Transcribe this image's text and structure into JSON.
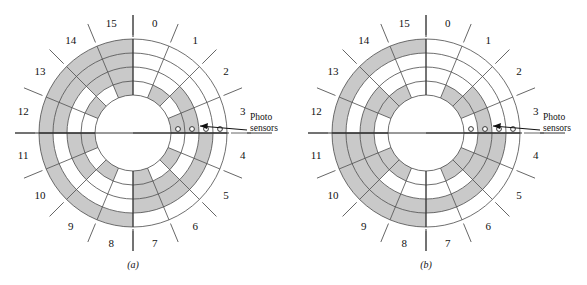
{
  "figure": {
    "type": "absolute-encoder-disk-diagram",
    "panels": [
      {
        "id": "a",
        "caption": "(a)",
        "encoding": "binary",
        "sector_count": 16,
        "track_count": 4,
        "sector_labels": [
          "0",
          "1",
          "2",
          "3",
          "4",
          "5",
          "6",
          "7",
          "8",
          "9",
          "10",
          "11",
          "12",
          "13",
          "14",
          "15"
        ],
        "sensor_label_line1": "Photo",
        "sensor_label_line2": "sensors",
        "sensor_count": 4,
        "tracks": [
          {
            "name": "outer-track-msb",
            "bit": 8,
            "values": [
              0,
              0,
              0,
              0,
              0,
              0,
              0,
              0,
              1,
              1,
              1,
              1,
              1,
              1,
              1,
              1
            ]
          },
          {
            "name": "track-3",
            "bit": 4,
            "values": [
              0,
              0,
              0,
              0,
              1,
              1,
              1,
              1,
              0,
              0,
              0,
              0,
              1,
              1,
              1,
              1
            ]
          },
          {
            "name": "track-2",
            "bit": 2,
            "values": [
              0,
              0,
              1,
              1,
              0,
              0,
              1,
              1,
              0,
              0,
              1,
              1,
              0,
              0,
              1,
              1
            ]
          },
          {
            "name": "inner-track-lsb",
            "bit": 1,
            "values": [
              0,
              1,
              0,
              1,
              0,
              1,
              0,
              1,
              0,
              1,
              0,
              1,
              0,
              1,
              0,
              1
            ]
          }
        ]
      },
      {
        "id": "b",
        "caption": "(b)",
        "encoding": "gray",
        "sector_count": 16,
        "track_count": 4,
        "sector_labels": [
          "0",
          "1",
          "2",
          "3",
          "4",
          "5",
          "6",
          "7",
          "8",
          "9",
          "10",
          "11",
          "12",
          "13",
          "14",
          "15"
        ],
        "sensor_label_line1": "Photo",
        "sensor_label_line2": "sensors",
        "sensor_count": 4,
        "tracks": [
          {
            "name": "outer-track-msb",
            "bit": 8,
            "values": [
              0,
              0,
              0,
              0,
              0,
              0,
              0,
              0,
              1,
              1,
              1,
              1,
              1,
              1,
              1,
              1
            ]
          },
          {
            "name": "track-3",
            "bit": 4,
            "values": [
              0,
              0,
              0,
              0,
              1,
              1,
              1,
              1,
              1,
              1,
              1,
              1,
              0,
              0,
              0,
              0
            ]
          },
          {
            "name": "track-2",
            "bit": 2,
            "values": [
              0,
              0,
              1,
              1,
              1,
              1,
              0,
              0,
              0,
              0,
              1,
              1,
              1,
              1,
              0,
              0
            ]
          },
          {
            "name": "inner-track-lsb",
            "bit": 1,
            "values": [
              0,
              1,
              1,
              0,
              0,
              1,
              1,
              0,
              0,
              1,
              1,
              0,
              0,
              1,
              1,
              0
            ]
          }
        ]
      }
    ],
    "colors": {
      "segment_on": "#c9c9c9",
      "segment_off": "#ffffff",
      "line": "#4a4a4a",
      "text": "#111111",
      "background": "#ffffff"
    },
    "geometry": {
      "center_x": 133,
      "center_y": 133,
      "hub_radius": 38,
      "ring_radii": [
        38,
        52,
        66,
        80,
        94
      ],
      "label_radius": 112,
      "tick_inner": 98,
      "tick_outer": 118
    }
  }
}
